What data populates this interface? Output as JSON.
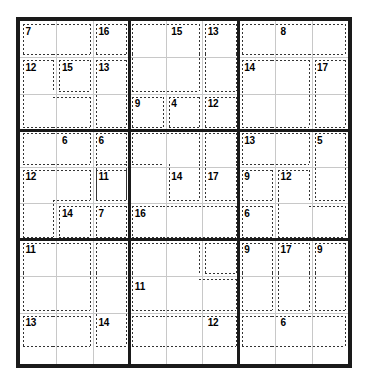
{
  "puzzle": {
    "type": "killer-sudoku",
    "grid_size": 9,
    "box_size": 3,
    "given_digits": [],
    "cell_px": 37,
    "colors": {
      "border": "#1a1a1a",
      "box_line": "#1a1a1a",
      "cell_line": "#c8c8c8",
      "cage_dash": "#333333",
      "background": "#ffffff",
      "sum_text": "#000000"
    },
    "cages": [
      {
        "id": "c1",
        "sum": "7",
        "label_cell": [
          0,
          0
        ],
        "cells": [
          [
            0,
            0
          ],
          [
            0,
            1
          ]
        ]
      },
      {
        "id": "c2",
        "sum": "16",
        "label_cell": [
          0,
          2
        ],
        "cells": [
          [
            0,
            2
          ]
        ]
      },
      {
        "id": "c3",
        "sum": "12",
        "label_cell": [
          1,
          0
        ],
        "cells": [
          [
            1,
            0
          ],
          [
            2,
            0
          ],
          [
            2,
            1
          ]
        ]
      },
      {
        "id": "c4",
        "sum": "15",
        "label_cell": [
          1,
          1
        ],
        "cells": [
          [
            1,
            1
          ]
        ]
      },
      {
        "id": "c5",
        "sum": "13",
        "label_cell": [
          1,
          2
        ],
        "cells": [
          [
            1,
            2
          ],
          [
            2,
            2
          ]
        ]
      },
      {
        "id": "c6",
        "sum": "15",
        "label_cell": [
          0,
          4
        ],
        "cells": [
          [
            0,
            3
          ],
          [
            0,
            4
          ],
          [
            1,
            3
          ],
          [
            1,
            4
          ]
        ]
      },
      {
        "id": "c7",
        "sum": "13",
        "label_cell": [
          0,
          5
        ],
        "cells": [
          [
            0,
            5
          ],
          [
            1,
            5
          ]
        ]
      },
      {
        "id": "c8",
        "sum": "9",
        "label_cell": [
          2,
          3
        ],
        "cells": [
          [
            2,
            3
          ]
        ]
      },
      {
        "id": "c9",
        "sum": "4",
        "label_cell": [
          2,
          4
        ],
        "cells": [
          [
            2,
            4
          ]
        ]
      },
      {
        "id": "c10",
        "sum": "12",
        "label_cell": [
          2,
          5
        ],
        "cells": [
          [
            2,
            5
          ]
        ]
      },
      {
        "id": "c11",
        "sum": "8",
        "label_cell": [
          0,
          7
        ],
        "cells": [
          [
            0,
            6
          ],
          [
            0,
            7
          ],
          [
            0,
            8
          ]
        ]
      },
      {
        "id": "c12",
        "sum": "14",
        "label_cell": [
          1,
          6
        ],
        "cells": [
          [
            1,
            6
          ],
          [
            2,
            6
          ],
          [
            1,
            7
          ],
          [
            2,
            7
          ]
        ]
      },
      {
        "id": "c13",
        "sum": "17",
        "label_cell": [
          1,
          8
        ],
        "cells": [
          [
            1,
            8
          ],
          [
            2,
            8
          ]
        ]
      },
      {
        "id": "c14",
        "sum": "6",
        "label_cell": [
          3,
          1
        ],
        "cells": [
          [
            3,
            0
          ],
          [
            3,
            1
          ]
        ]
      },
      {
        "id": "c15",
        "sum": "6",
        "label_cell": [
          3,
          2
        ],
        "cells": [
          [
            3,
            2
          ],
          [
            4,
            2
          ]
        ]
      },
      {
        "id": "c16",
        "sum": "12",
        "label_cell": [
          4,
          0
        ],
        "cells": [
          [
            4,
            0
          ],
          [
            5,
            0
          ],
          [
            4,
            1
          ]
        ]
      },
      {
        "id": "c17",
        "sum": "11",
        "label_cell": [
          4,
          2
        ],
        "cells": [
          [
            4,
            2
          ]
        ]
      },
      {
        "id": "c18",
        "sum": "14",
        "label_cell": [
          5,
          1
        ],
        "cells": [
          [
            5,
            1
          ]
        ]
      },
      {
        "id": "c19",
        "sum": "7",
        "label_cell": [
          5,
          2
        ],
        "cells": [
          [
            5,
            2
          ]
        ]
      },
      {
        "id": "c20",
        "sum": "14",
        "label_cell": [
          4,
          4
        ],
        "cells": [
          [
            3,
            3
          ],
          [
            3,
            4
          ],
          [
            4,
            4
          ]
        ]
      },
      {
        "id": "c21",
        "sum": "17",
        "label_cell": [
          4,
          5
        ],
        "cells": [
          [
            3,
            5
          ],
          [
            4,
            5
          ]
        ]
      },
      {
        "id": "c22",
        "sum": "16",
        "label_cell": [
          5,
          3
        ],
        "cells": [
          [
            5,
            3
          ],
          [
            5,
            4
          ],
          [
            5,
            5
          ]
        ]
      },
      {
        "id": "c23",
        "sum": "13",
        "label_cell": [
          3,
          6
        ],
        "cells": [
          [
            3,
            6
          ],
          [
            3,
            7
          ]
        ]
      },
      {
        "id": "c24",
        "sum": "5",
        "label_cell": [
          3,
          8
        ],
        "cells": [
          [
            3,
            8
          ],
          [
            4,
            8
          ]
        ]
      },
      {
        "id": "c25",
        "sum": "9",
        "label_cell": [
          4,
          6
        ],
        "cells": [
          [
            4,
            6
          ]
        ]
      },
      {
        "id": "c26",
        "sum": "12",
        "label_cell": [
          4,
          7
        ],
        "cells": [
          [
            4,
            7
          ],
          [
            5,
            7
          ],
          [
            5,
            8
          ]
        ]
      },
      {
        "id": "c27",
        "sum": "6",
        "label_cell": [
          5,
          6
        ],
        "cells": [
          [
            5,
            6
          ]
        ]
      },
      {
        "id": "c28",
        "sum": "11",
        "label_cell": [
          6,
          0
        ],
        "cells": [
          [
            6,
            0
          ],
          [
            7,
            0
          ],
          [
            6,
            1
          ],
          [
            7,
            1
          ]
        ]
      },
      {
        "id": "c29",
        "sum": "13",
        "label_cell": [
          8,
          0
        ],
        "cells": [
          [
            8,
            0
          ],
          [
            8,
            1
          ]
        ]
      },
      {
        "id": "c30",
        "sum": "14",
        "label_cell": [
          8,
          2
        ],
        "cells": [
          [
            6,
            2
          ],
          [
            7,
            2
          ],
          [
            8,
            2
          ]
        ]
      },
      {
        "id": "c31",
        "sum": "11",
        "label_cell": [
          7,
          3
        ],
        "cells": [
          [
            6,
            3
          ],
          [
            6,
            4
          ],
          [
            7,
            3
          ],
          [
            7,
            4
          ],
          [
            7,
            5
          ]
        ]
      },
      {
        "id": "c32",
        "sum": "12",
        "label_cell": [
          8,
          5
        ],
        "cells": [
          [
            6,
            5
          ],
          [
            8,
            3
          ],
          [
            8,
            4
          ],
          [
            8,
            5
          ]
        ]
      },
      {
        "id": "c33",
        "sum": "9",
        "label_cell": [
          6,
          6
        ],
        "cells": [
          [
            6,
            6
          ],
          [
            7,
            6
          ]
        ]
      },
      {
        "id": "c34",
        "sum": "17",
        "label_cell": [
          6,
          7
        ],
        "cells": [
          [
            6,
            7
          ],
          [
            7,
            7
          ]
        ]
      },
      {
        "id": "c35",
        "sum": "9",
        "label_cell": [
          6,
          8
        ],
        "cells": [
          [
            6,
            8
          ],
          [
            7,
            8
          ]
        ]
      },
      {
        "id": "c36",
        "sum": "6",
        "label_cell": [
          8,
          7
        ],
        "cells": [
          [
            8,
            6
          ],
          [
            8,
            7
          ],
          [
            8,
            8
          ]
        ]
      }
    ]
  }
}
